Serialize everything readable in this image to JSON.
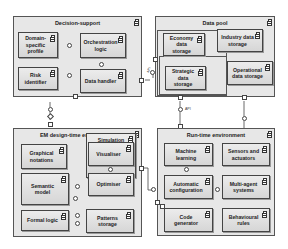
{
  "diagram": {
    "type": "UML component diagram",
    "frames": {
      "decision_support": {
        "title": "Decision-support",
        "components": {
          "domain_profile": "Domain-\nspecific profile",
          "orchestration": "Orchestration\nlogic",
          "risk_identifier": "Risk identifier",
          "data_handler": "Data handler"
        }
      },
      "data_pool": {
        "title": "Data pool",
        "components": {
          "economy": "Economy data\nstorage",
          "industry": "Industry data\nstorage",
          "strategic": "Strategic data\nstorage",
          "operational": "Operational\ndata storage"
        }
      },
      "em_design": {
        "title": "EM design-time environment",
        "components": {
          "graphical": "Graphical\nnotations",
          "simulation": "Simulation",
          "visualiser": "Visualiser",
          "semantic": "Semantic\nmodel",
          "optimiser": "Optimiser",
          "formal_logic": "Formal logic",
          "patterns": "Patterns\nstorage"
        }
      },
      "runtime": {
        "title": "Run-time environment",
        "components": {
          "ml": "Machine\nlearning",
          "sensors": "Sensors and\nactuators",
          "autoconf": "Automatic\nconfiguration",
          "multiagent": "Multi-agent\nsystems",
          "codegen": "Code\ngenerator",
          "behavioural": "Behavioural\nrules"
        }
      }
    },
    "interface_labels": {
      "api_left": "API",
      "api_mid": "API"
    },
    "colors": {
      "frame_fill": "#e7e7e7",
      "component_fill": "#dcdcdc",
      "line": "#444444"
    }
  }
}
